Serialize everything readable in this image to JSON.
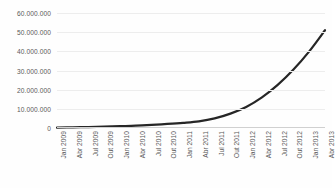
{
  "chart_data": {
    "type": "line",
    "title": "",
    "xlabel": "",
    "ylabel": "",
    "grid": true,
    "legend": false,
    "ylim": [
      0,
      60000000
    ],
    "yticks": [
      0,
      10000000,
      20000000,
      30000000,
      40000000,
      50000000,
      60000000
    ],
    "ytick_labels": [
      "0",
      "10.000.000",
      "20.000.000",
      "30.000.000",
      "40.000.000",
      "50.000.000",
      "60.000.000"
    ],
    "categories": [
      "Jan 2009",
      "Abr 2009",
      "Jul 2009",
      "Out 2009",
      "Jan 2010",
      "Abr 2010",
      "Jul 2010",
      "Out 2010",
      "Jan 2011",
      "Abr 2011",
      "Jul 2011",
      "Out 2011",
      "Jan 2012",
      "Abr 2012",
      "Jul 2012",
      "Out 2012",
      "Jan 2013",
      "Abr 2013"
    ],
    "series": [
      {
        "name": "",
        "color": "#262626",
        "line_width": 2.2,
        "values": [
          200000,
          350000,
          500000,
          700000,
          950000,
          1200000,
          1600000,
          2100000,
          2700000,
          3500000,
          5000000,
          7500000,
          11000000,
          16000000,
          22500000,
          30500000,
          40000000,
          51000000
        ]
      }
    ]
  },
  "style": {
    "background": "#fefefe",
    "gridline_color": "#ededed",
    "axis_color": "#d0d0d0",
    "label_color": "#5a5a5a"
  }
}
